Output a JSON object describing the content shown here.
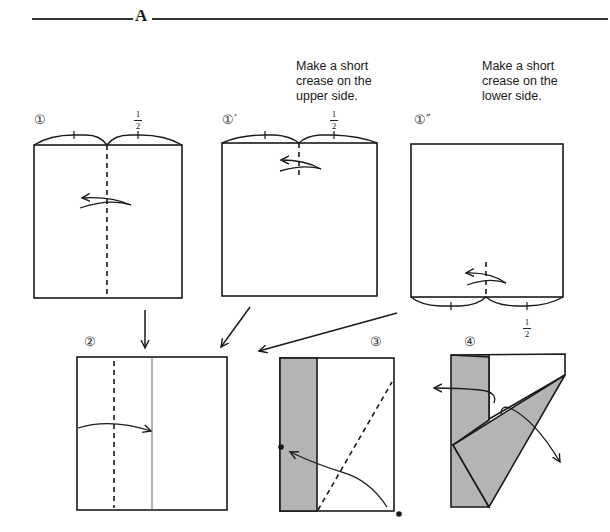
{
  "section": {
    "label": "A"
  },
  "steps": [
    {
      "id": "1",
      "label": "①"
    },
    {
      "id": "1p",
      "label": "①′"
    },
    {
      "id": "1pp",
      "label": "①″"
    },
    {
      "id": "2",
      "label": "②"
    },
    {
      "id": "3",
      "label": "③"
    },
    {
      "id": "4",
      "label": "④"
    }
  ],
  "notes": {
    "upper": "Make a short\ncrease on the\nupper side.",
    "lower": "Make a short\ncrease on the\nlower side."
  },
  "fractions": [
    {
      "num": "1",
      "den": "2"
    },
    {
      "num": "1",
      "den": "2"
    },
    {
      "num": "1",
      "den": "2"
    }
  ],
  "colors": {
    "line": "#1a1a1a",
    "shade": "#b4b4b4",
    "paper": "#ffffff"
  }
}
